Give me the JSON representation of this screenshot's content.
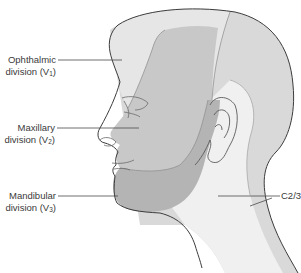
{
  "diagram": {
    "colors": {
      "v1": "#e6e6e6",
      "v2": "#c8c8c8",
      "v3": "#b4b4b4",
      "c23": "#d9d9d9",
      "neck_light": "#f0f0f0",
      "outline": "#3c3c3c",
      "leader": "#4a4a4a"
    },
    "labels": [
      {
        "id": "ophthalmic",
        "line1": "Ophthalmic",
        "line2_prefix": "division (V",
        "subscript": "1",
        "line2_suffix": ")"
      },
      {
        "id": "maxillary",
        "line1": "Maxillary",
        "line2_prefix": "division (V",
        "subscript": "2",
        "line2_suffix": ")"
      },
      {
        "id": "mandibular",
        "line1": "Mandibular",
        "line2_prefix": "division (V",
        "subscript": "3",
        "line2_suffix": ")"
      },
      {
        "id": "c23",
        "line1": "C2/3"
      }
    ]
  }
}
